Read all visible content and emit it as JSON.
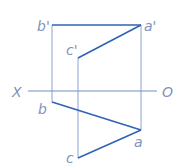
{
  "diagram": {
    "type": "orthographic-projection",
    "colors": {
      "object_line": "#2f63b5",
      "projection_line": "#8aa4d4",
      "axis_line": "#6f8fc8",
      "label": "#7f93b8"
    },
    "axis": {
      "left_label": "X",
      "right_label": "O"
    },
    "points": {
      "b_prime": {
        "label": "b'",
        "x": 52,
        "y": 25
      },
      "a_prime": {
        "label": "a'",
        "x": 141,
        "y": 25
      },
      "c_prime": {
        "label": "c'",
        "x": 78,
        "y": 58
      },
      "b": {
        "label": "b",
        "x": 52,
        "y": 102
      },
      "a": {
        "label": "a",
        "x": 141,
        "y": 130
      },
      "c": {
        "label": "c",
        "x": 78,
        "y": 158
      }
    }
  }
}
